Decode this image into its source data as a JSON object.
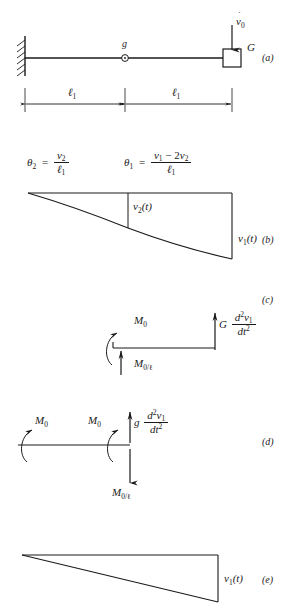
{
  "figure": {
    "type": "structural-dynamics-diagram",
    "panels": [
      {
        "id": "a",
        "letter": "(a)",
        "name": "beam-model",
        "support": "fixed",
        "mass_label": "G",
        "midspan_marker_label": "g",
        "applied_motion_label": "v̈0",
        "applied_motion_base": "v",
        "applied_motion_sub": "0",
        "dimensions": [
          {
            "label_base": "ℓ",
            "label_sub": "1"
          },
          {
            "label_base": "ℓ",
            "label_sub": "1"
          }
        ]
      },
      {
        "id": "b",
        "letter": "(b)",
        "name": "deflected-shape-curved",
        "labels": [
          {
            "base": "v",
            "sub": "2",
            "suffix": "(t)"
          },
          {
            "base": "v",
            "sub": "1",
            "suffix": "(t)"
          }
        ]
      },
      {
        "id": "c",
        "letter": "(c)",
        "name": "free-body-diagram-segment",
        "moment_label_base": "M",
        "moment_label_sub": "0",
        "reaction_label": "M0/ℓ",
        "reaction_base": "M",
        "reaction_sub": "0",
        "reaction_den": "/ℓ",
        "inertia_coefficient": "G",
        "inertia_num": "d²v₁",
        "inertia_den": "dt²"
      },
      {
        "id": "d",
        "letter": "(d)",
        "name": "free-body-diagram-joint",
        "moment_left_base": "M",
        "moment_left_sub": "0",
        "moment_right_base": "M",
        "moment_right_sub": "0",
        "reaction_base": "M",
        "reaction_sub": "0",
        "reaction_den": "/ℓ",
        "inertia_coefficient": "g",
        "inertia_num": "d²v₁",
        "inertia_den": "dt²"
      },
      {
        "id": "e",
        "letter": "(e)",
        "name": "deflected-shape-linear",
        "labels": [
          {
            "base": "v",
            "sub": "1",
            "suffix": "(t)"
          }
        ]
      }
    ],
    "equations": [
      {
        "name": "theta-2",
        "lhs_base": "θ",
        "lhs_sub": "2",
        "equals": "=",
        "num_base": "v",
        "num_sub": "2",
        "den_base": "ℓ",
        "den_sub": "1"
      },
      {
        "name": "theta-1",
        "lhs_base": "θ",
        "lhs_sub": "1",
        "equals": "=",
        "num": "v₁ − 2v₂",
        "num_first_base": "v",
        "num_first_sub": "1",
        "num_op": " − 2",
        "num_second_base": "v",
        "num_second_sub": "2",
        "den_base": "ℓ",
        "den_sub": "1"
      }
    ],
    "colors": {
      "line": "#1a1a1a",
      "background": "#ffffff"
    }
  }
}
